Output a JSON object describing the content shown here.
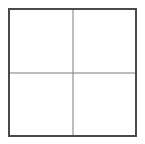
{
  "figure": {
    "kind": "grid-diagram",
    "width_px": 145,
    "height_px": 144,
    "background_color": "#ffffff"
  },
  "frame": {
    "border_color": "#4a4a4a",
    "border_width_px": 2,
    "fill_color": "#ffffff",
    "left_px": 8,
    "top_px": 8,
    "width_px": 129,
    "height_px": 129
  },
  "dividers": {
    "color": "#7f7f7f",
    "width_px": 1,
    "vertical_x_px": 72,
    "horizontal_y_px": 72
  },
  "cells": {
    "rows": 2,
    "columns": 2,
    "items": [
      {
        "id": "top-left",
        "label": ""
      },
      {
        "id": "top-right",
        "label": ""
      },
      {
        "id": "bottom-left",
        "label": ""
      },
      {
        "id": "bottom-right",
        "label": ""
      }
    ]
  }
}
